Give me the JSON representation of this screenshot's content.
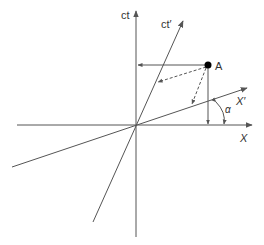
{
  "diagram": {
    "labels": {
      "ct": "ct",
      "ct_prime": "ct′",
      "x": "X",
      "x_prime": "X′",
      "point": "A",
      "angle": "α"
    },
    "colors": {
      "line": "#555555",
      "point": "#000000",
      "text": "#333333"
    }
  }
}
